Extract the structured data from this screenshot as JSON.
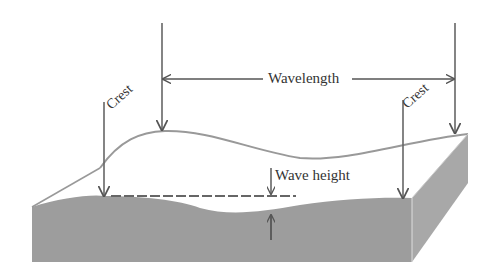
{
  "diagram": {
    "labels": {
      "wavelength": "Wavelength",
      "crest_left": "Crest",
      "crest_right": "Crest",
      "wave_height": "Wave height"
    },
    "colors": {
      "water_front": "#9d9d9d",
      "water_side": "#a8a8a8",
      "top_surface": "#ffffff",
      "lines": "#666666",
      "text": "#333333"
    }
  }
}
